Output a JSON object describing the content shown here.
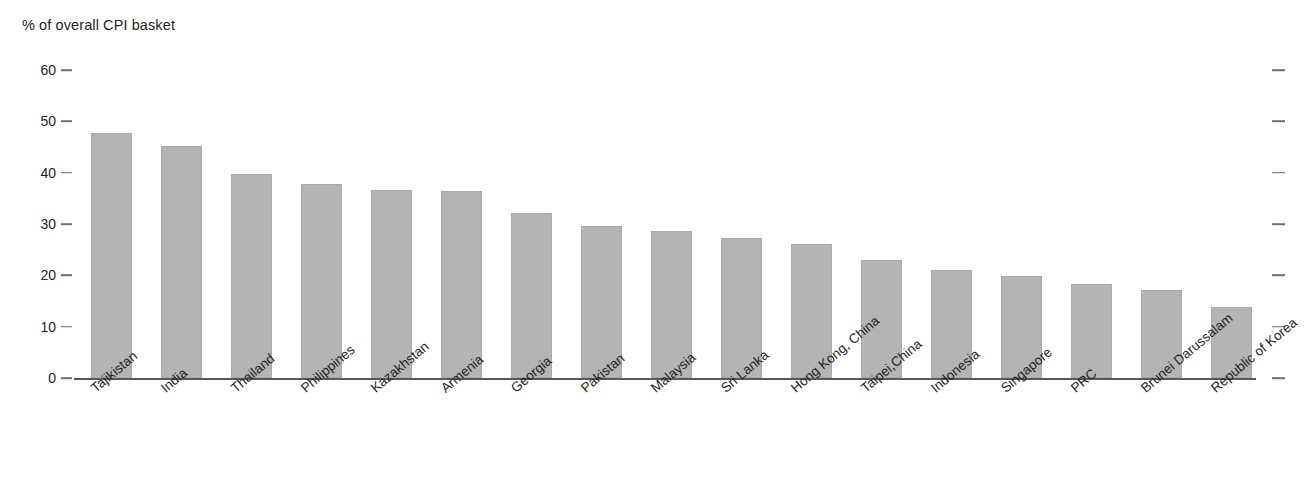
{
  "chart_data": {
    "type": "bar",
    "title": "",
    "ylabel": "% of overall CPI basket",
    "xlabel": "",
    "ylim": [
      0,
      60
    ],
    "yticks": [
      0,
      10,
      20,
      30,
      40,
      50,
      60
    ],
    "grid": false,
    "legend": null,
    "bar_color": "#b4b4b4",
    "categories": [
      "Tajikistan",
      "India",
      "Thailand",
      "Philippines",
      "Kazakhstan",
      "Armenia",
      "Georgia",
      "Pakistan",
      "Malaysia",
      "Sri Lanka",
      "Hong Kong, China",
      "Taipei,China",
      "Indonesia",
      "Singapore",
      "PRC",
      "Brunei Darussalam",
      "Republic of Korea"
    ],
    "values": [
      47.8,
      45.1,
      39.8,
      37.8,
      36.6,
      36.5,
      32.2,
      29.6,
      28.7,
      27.2,
      26.1,
      23.0,
      21.0,
      19.8,
      18.4,
      17.2,
      13.8
    ]
  },
  "axis": {
    "title": "% of overall CPI basket",
    "tick_labels": [
      "60",
      "50",
      "40",
      "30",
      "20",
      "10",
      "0"
    ]
  }
}
